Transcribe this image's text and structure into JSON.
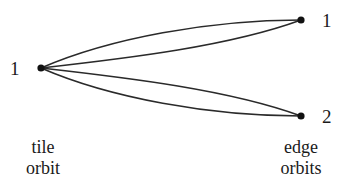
{
  "diagram": {
    "nodes": [
      {
        "id": "tile-1",
        "label": "1",
        "x": 41,
        "y": 68,
        "group": "tile"
      },
      {
        "id": "edge-1",
        "label": "1",
        "x": 301,
        "y": 20,
        "group": "edge"
      },
      {
        "id": "edge-2",
        "label": "2",
        "x": 301,
        "y": 116,
        "group": "edge"
      }
    ],
    "edges": [
      {
        "from": "tile-1",
        "to": "edge-1",
        "count": 2
      },
      {
        "from": "tile-1",
        "to": "edge-2",
        "count": 2
      }
    ],
    "labels": {
      "tile_node": "1",
      "edge_node_top": "1",
      "edge_node_bottom": "2"
    },
    "captions": {
      "tile": {
        "line1": "tile",
        "line2": "orbit"
      },
      "edge": {
        "line1": "edge",
        "line2": "orbits"
      }
    },
    "colors": {
      "ink": "#1a1a1a",
      "background": "#ffffff"
    }
  }
}
